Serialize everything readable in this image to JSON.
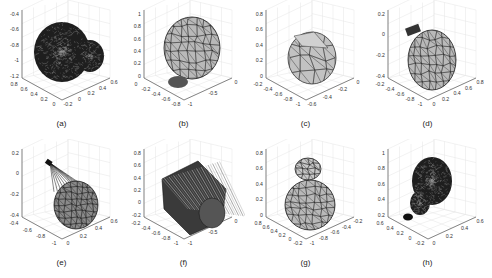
{
  "figure": {
    "layout": {
      "rows": 2,
      "cols": 4
    },
    "panels": [
      {
        "id": "a",
        "caption": "(a)",
        "style": "dense-dark",
        "z_ticks": [
          "-0.4",
          "-0.6",
          "-0.8",
          "-1",
          "-1.2"
        ],
        "x_ticks": [
          "0.8",
          "0.6",
          "0.4",
          "0.2",
          "0"
        ],
        "y_ticks": [
          "-0.2",
          "0",
          "0.2",
          "0.4",
          "0.6"
        ]
      },
      {
        "id": "b",
        "caption": "(b)",
        "style": "gray-mesh",
        "z_ticks": [
          "1",
          "0.8",
          "0.6",
          "0.4",
          "0.2",
          "0"
        ],
        "x_ticks": [
          "0",
          "-0.2",
          "-0.4",
          "-0.6",
          "-0.8"
        ],
        "y_ticks": [
          "-1",
          "-0.5",
          "0"
        ]
      },
      {
        "id": "c",
        "caption": "(c)",
        "style": "gray-coarse",
        "z_ticks": [
          "0.8",
          "0.6",
          "0.4",
          "0.2",
          "0"
        ],
        "x_ticks": [
          "-0.2",
          "-0.4",
          "-0.6",
          "-0.8",
          "-1"
        ],
        "y_ticks": [
          "-0.6",
          "-0.4",
          "-0.2",
          "0"
        ]
      },
      {
        "id": "d",
        "caption": "(d)",
        "style": "gray-mesh-cap",
        "z_ticks": [
          "0.2",
          "0",
          "-0.2",
          "-0.4"
        ],
        "x_ticks": [
          "-0.2",
          "-0.4",
          "-0.6",
          "-0.8",
          "-1"
        ],
        "y_ticks": [
          "0",
          "0.2",
          "0.4",
          "0.6",
          "0.8"
        ]
      },
      {
        "id": "e",
        "caption": "(e)",
        "style": "fan-dark",
        "z_ticks": [
          "0.2",
          "0",
          "-0.2",
          "-0.4"
        ],
        "x_ticks": [
          "-0.4",
          "-0.6",
          "-0.8",
          "-1"
        ],
        "y_ticks": [
          "0",
          "0.2",
          "0.4",
          "0.6"
        ]
      },
      {
        "id": "f",
        "caption": "(f)",
        "style": "cylinder-dark",
        "z_ticks": [
          "0.8",
          "0.6",
          "0.4",
          "0.2",
          "0",
          "-0.2"
        ],
        "x_ticks": [
          "-0.2",
          "-0.4",
          "-0.6",
          "-0.8",
          "-1"
        ],
        "y_ticks": [
          "-1",
          "-0.5",
          "0"
        ]
      },
      {
        "id": "g",
        "caption": "(g)",
        "style": "gray-mesh-neck",
        "z_ticks": [
          "0.8",
          "0.6",
          "0.4",
          "0.2",
          "0"
        ],
        "x_ticks": [
          "0.8",
          "0.6",
          "0.4",
          "0.2",
          "0",
          "-0.2"
        ],
        "y_ticks": [
          "-1",
          "-0.8",
          "-0.6",
          "-0.4",
          "-0.2"
        ]
      },
      {
        "id": "h",
        "caption": "(h)",
        "style": "dense-pear",
        "z_ticks": [
          "1",
          "0.8",
          "0.6",
          "0.4",
          "0.2"
        ],
        "x_ticks": [
          "0.6",
          "0.4",
          "0.2",
          "0",
          "-0.2"
        ],
        "y_ticks": [
          "0",
          "0.2",
          "0.4",
          "0.6"
        ]
      }
    ]
  },
  "colors": {
    "mesh_fill": "#b9b9b9",
    "mesh_edge": "#1a1a1a",
    "dark_fill": "#2a2a2a",
    "grid": "#e4e4e4",
    "axis": "#555555"
  }
}
